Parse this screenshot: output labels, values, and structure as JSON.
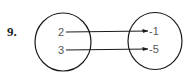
{
  "problem": {
    "number": "9."
  },
  "mapping": {
    "domain": [
      "2",
      "3"
    ],
    "range": [
      "-1",
      "-5"
    ],
    "arrows": [
      {
        "from": "2",
        "to": "-1"
      },
      {
        "from": "3",
        "to": "-5"
      }
    ]
  },
  "colors": {
    "stroke": "#1a1a1a",
    "text": "#555555"
  }
}
